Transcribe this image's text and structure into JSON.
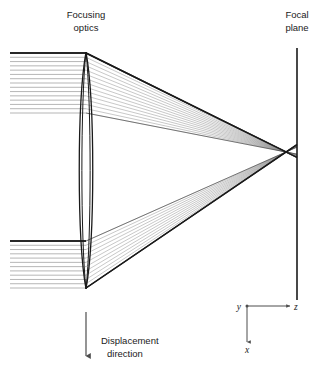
{
  "figure": {
    "type": "optical-ray-diagram",
    "background_color": "#ffffff",
    "width": 322,
    "height": 382,
    "labels": {
      "focusing_optics_line1": "Focusing",
      "focusing_optics_line2": "optics",
      "focal_plane_line1": "Focal",
      "focal_plane_line2": "plane",
      "displacement_line1": "Displacement",
      "displacement_line2": "direction"
    },
    "axes": {
      "y_label": "y",
      "z_label": "z",
      "x_label": "x",
      "origin_x": 247,
      "origin_y": 306,
      "z_end_x": 290,
      "x_end_y": 342,
      "color": "#4d4d4d"
    },
    "colors": {
      "ray_light": "#8c8c8c",
      "ray_dark": "#1a1a1a",
      "lens_stroke": "#1a1a1a",
      "focal_plane_stroke": "#1a1a1a",
      "arrow_stroke": "#4d4d4d",
      "text": "#1a1a1a"
    },
    "lens": {
      "center_x": 86,
      "top_y": 52,
      "bottom_y": 289,
      "half_width": 9,
      "inner_half_width": 5.5,
      "shape": "biconvex-lens-ellipse"
    },
    "focal_plane": {
      "x": 297,
      "top_y": 48,
      "bottom_y": 300
    },
    "focus_point": {
      "x": 286,
      "y": 152
    },
    "upper_beam": {
      "incoming_left_x": 10,
      "top_y": 53,
      "bottom_y": 113,
      "ray_count": 15
    },
    "lower_beam": {
      "incoming_left_x": 10,
      "top_y": 241,
      "bottom_y": 288,
      "ray_count": 12
    },
    "displacement_arrow": {
      "x": 86,
      "top_y": 312,
      "bottom_y": 356
    }
  }
}
